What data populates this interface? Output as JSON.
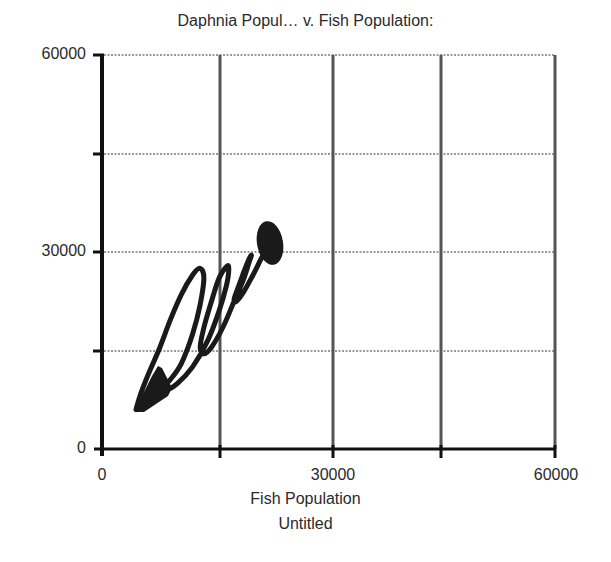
{
  "chart": {
    "title": "Daphnia Popul… v. Fish Population:",
    "xlabel": "Fish Population",
    "subtitle": "Untitled",
    "y_ticks": [
      "0",
      "30000",
      "60000"
    ],
    "x_ticks": [
      "0",
      "30000",
      "60000"
    ]
  },
  "colors": {
    "axis": "#111111",
    "gridline_vertical": "#555555",
    "gridline_horizontal": "#999999",
    "curve": "#1a1a1a"
  },
  "chart_data": {
    "type": "line",
    "title": "Daphnia Popul… v. Fish Population:",
    "subtitle": "Untitled",
    "xlabel": "Fish Population",
    "ylabel": "Daphnia Population",
    "xlim": [
      0,
      60000
    ],
    "ylim": [
      0,
      60000
    ],
    "x_ticks": [
      0,
      30000,
      60000
    ],
    "y_ticks": [
      0,
      30000,
      60000
    ],
    "grid": true,
    "grid_step": 15000,
    "legend": null,
    "series": [
      {
        "name": "Daphnia Population vs Fish Population (phase trajectory)",
        "x": [
          4500,
          5000,
          6000,
          7500,
          9000,
          10500,
          12000,
          13000,
          13500,
          13000,
          12000,
          10500,
          9000,
          8000,
          8500,
          10000,
          12000,
          14000,
          15500,
          16500,
          16800,
          16500,
          15500,
          14500,
          13500,
          13000,
          13500,
          14500,
          16000,
          17500,
          18800,
          19500,
          19800,
          19500,
          18800,
          18000,
          17500,
          17800,
          18800,
          20000,
          21000,
          21800,
          22300,
          22500,
          22300,
          21800,
          21300,
          21200,
          21500,
          22000,
          22400,
          22500
        ],
        "y": [
          6000,
          8000,
          11000,
          15000,
          19500,
          23500,
          26500,
          27500,
          26000,
          22000,
          17500,
          13000,
          10500,
          9500,
          9000,
          10000,
          12500,
          16500,
          21000,
          25000,
          27500,
          27800,
          26000,
          22500,
          18500,
          15500,
          14500,
          15500,
          18500,
          22500,
          26000,
          28500,
          29500,
          29000,
          27000,
          24500,
          22800,
          22500,
          24000,
          26500,
          28800,
          30500,
          31500,
          32000,
          31800,
          31000,
          30200,
          30000,
          30500,
          31200,
          31500,
          31300
        ]
      }
    ]
  }
}
